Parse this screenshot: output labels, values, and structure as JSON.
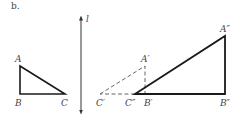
{
  "part_label": "b.",
  "line_label": "l",
  "colors": {
    "stroke": "#1a1a1a",
    "dashed": "#555555",
    "line": "#333333",
    "text": "#444444"
  },
  "triangle_original": {
    "vertices": {
      "A": "A",
      "B": "B",
      "C": "C"
    }
  },
  "triangle_reflected": {
    "vertices": {
      "A": "A′",
      "B": "B′",
      "C": "C′"
    },
    "style": "dashed"
  },
  "triangle_dilated": {
    "vertices": {
      "A": "A″",
      "B": "B″",
      "C": "C″"
    },
    "style": "bold"
  }
}
